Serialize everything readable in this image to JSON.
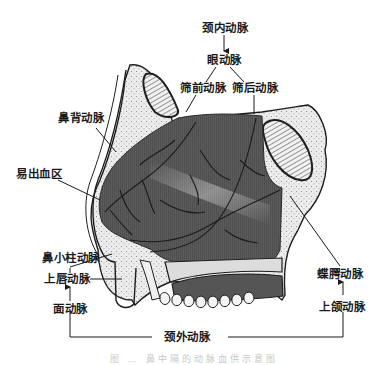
{
  "figure": {
    "labels": {
      "internal_carotid": "颈内动脉",
      "ophthalmic": "眼动脉",
      "anterior_ethmoidal": "筛前动脉",
      "posterior_ethmoidal": "筛后动脉",
      "dorsal_nasal": "鼻背动脉",
      "bleeding_area": "易出血区",
      "columellar": "鼻小柱动脉",
      "superior_labial": "上唇动脉",
      "facial": "面动脉",
      "sphenopalatine": "蝶腭动脉",
      "maxillary": "上颌动脉",
      "external_carotid": "颈外动脉"
    },
    "caption": "图 … 鼻中隔的动脉血供示意图",
    "colors": {
      "septum_fill": "#5a5a5a",
      "bone_fill": "#e8e8e8",
      "outline": "#1e1e1e",
      "text": "#1a1a1a"
    },
    "flow_relations": [
      {
        "from": "颈内动脉",
        "to": "眼动脉"
      },
      {
        "from": "眼动脉",
        "to": "筛前动脉"
      },
      {
        "from": "眼动脉",
        "to": "筛后动脉"
      },
      {
        "from": "颈外动脉",
        "to": "面动脉"
      },
      {
        "from": "面动脉",
        "to": "上唇动脉"
      },
      {
        "from": "上唇动脉",
        "to": "鼻小柱动脉"
      },
      {
        "from": "颈外动脉",
        "to": "上颌动脉"
      },
      {
        "from": "上颌动脉",
        "to": "蝶腭动脉"
      }
    ]
  }
}
